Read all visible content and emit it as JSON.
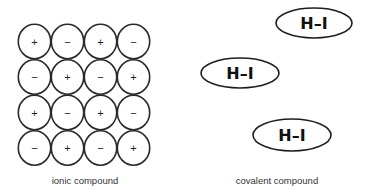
{
  "ionic": {
    "label": "ionic compound",
    "grid": [
      [
        "+",
        "−",
        "+",
        "−"
      ],
      [
        "−",
        "+",
        "−",
        "+"
      ],
      [
        "+",
        "−",
        "+",
        "−"
      ],
      [
        "−",
        "+",
        "−",
        "+"
      ]
    ]
  },
  "covalent": {
    "label": "covalent compound",
    "molecules": [
      {
        "formula": "H–I"
      },
      {
        "formula": "H–I"
      },
      {
        "formula": "H–I"
      }
    ]
  }
}
